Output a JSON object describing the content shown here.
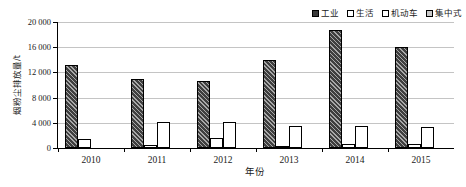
{
  "chart_data": {
    "type": "bar",
    "title": "",
    "xlabel": "年份",
    "ylabel": "烟粉尘排放量/t",
    "ylim": [
      0,
      20000
    ],
    "ytick_step": 4000,
    "ytick_labels": [
      "0",
      "4 000",
      "8 000",
      "12 000",
      "16 000",
      "20 000"
    ],
    "ytick_values": [
      0,
      4000,
      8000,
      12000,
      16000,
      20000
    ],
    "grid": true,
    "legend_position": "top-right",
    "categories": [
      "2010",
      "2011",
      "2012",
      "2013",
      "2014",
      "2015"
    ],
    "series": [
      {
        "name": "工业",
        "key": "industrial",
        "color": "#3f3f3f",
        "pattern": "diagonal-hatch",
        "values": [
          13100,
          11000,
          10600,
          14000,
          18800,
          16000
        ]
      },
      {
        "name": "生活",
        "key": "residential",
        "color": "#ffffff",
        "pattern": "solid",
        "values": [
          1500,
          500,
          1650,
          300,
          650,
          650
        ]
      },
      {
        "name": "机动车",
        "key": "vehicle",
        "color": "#ffffff",
        "pattern": "solid",
        "values": [
          0,
          4200,
          4200,
          3500,
          3450,
          3400
        ]
      },
      {
        "name": "集中式",
        "key": "central",
        "color": "#d2d2d2",
        "pattern": "solid",
        "values": [
          0,
          0,
          0,
          0,
          0,
          0
        ]
      }
    ]
  },
  "legend": {
    "entries": [
      {
        "label": "工业"
      },
      {
        "label": "生活"
      },
      {
        "label": "机动车"
      },
      {
        "label": "集中式"
      }
    ]
  }
}
